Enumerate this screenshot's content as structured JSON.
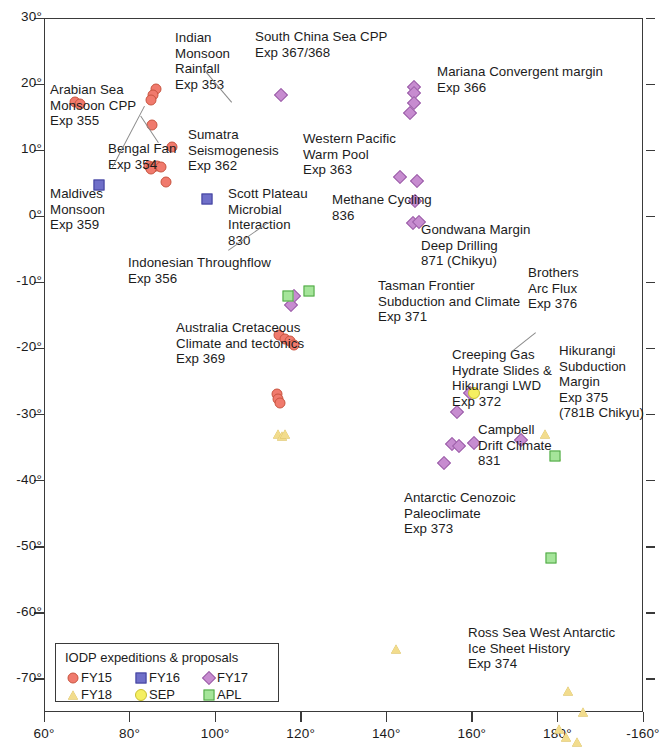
{
  "chart_data": {
    "type": "scatter",
    "title": "",
    "xlabel": "",
    "ylabel": "",
    "xlim": [
      60,
      200
    ],
    "ylim": [
      -75,
      30
    ],
    "grid": false,
    "legend_position": "bottom-left",
    "x_ticks": [
      "60°",
      "80°",
      "100°",
      "120°",
      "140°",
      "160°",
      "180°",
      "-160°"
    ],
    "x_tick_values": [
      60,
      80,
      100,
      120,
      140,
      160,
      180,
      200
    ],
    "y_ticks": [
      "30°",
      "20°",
      "10°",
      "0°",
      "-10°",
      "-20°",
      "-30°",
      "-40°",
      "-50°",
      "-60°",
      "-70°"
    ],
    "y_tick_values": [
      30,
      20,
      10,
      0,
      -10,
      -20,
      -30,
      -40,
      -50,
      -60,
      -70
    ],
    "series": [
      {
        "name": "FY15",
        "color": "#f07a6d",
        "marker": "circle",
        "points": [
          [
            67.2,
            17.3
          ],
          [
            68.4,
            17.0
          ],
          [
            86.2,
            19.2
          ],
          [
            85.4,
            18.3
          ],
          [
            85.0,
            17.6
          ],
          [
            85.2,
            13.8
          ],
          [
            89.8,
            10.5
          ],
          [
            84.6,
            7.6
          ],
          [
            85.4,
            7.5
          ],
          [
            86.3,
            7.6
          ],
          [
            87.3,
            7.5
          ],
          [
            85.0,
            7.2
          ],
          [
            88.5,
            5.2
          ],
          [
            115.0,
            -18.0
          ],
          [
            116.4,
            -18.5
          ],
          [
            117.6,
            -18.9
          ],
          [
            118.4,
            -19.4
          ],
          [
            114.5,
            -26.9
          ],
          [
            114.8,
            -27.6
          ],
          [
            115.1,
            -28.3
          ]
        ]
      },
      {
        "name": "FY16",
        "color": "#6f6fc9",
        "marker": "square",
        "points": [
          [
            72.9,
            4.8
          ],
          [
            98.0,
            2.6
          ]
        ]
      },
      {
        "name": "FY17",
        "color": "#c78cd0",
        "marker": "diamond",
        "points": [
          [
            115.3,
            18.4
          ],
          [
            146.4,
            19.6
          ],
          [
            146.5,
            18.6
          ],
          [
            146.4,
            17.2
          ],
          [
            145.6,
            15.7
          ],
          [
            143.2,
            5.9
          ],
          [
            147.2,
            5.4
          ],
          [
            146.6,
            2.3
          ],
          [
            146.3,
            -1.0
          ],
          [
            147.6,
            -0.8
          ],
          [
            118.5,
            -12.0
          ],
          [
            117.8,
            -13.4
          ],
          [
            159.6,
            -26.8
          ],
          [
            156.6,
            -29.6
          ],
          [
            155.3,
            -34.5
          ],
          [
            157.0,
            -34.8
          ],
          [
            160.5,
            -34.3
          ],
          [
            153.5,
            -37.3
          ],
          [
            171.6,
            -33.8
          ]
        ]
      },
      {
        "name": "FY18",
        "color": "#f2dc8d",
        "marker": "triangle",
        "points": [
          [
            114.6,
            -33.0
          ],
          [
            115.6,
            -33.2
          ],
          [
            116.3,
            -32.9
          ],
          [
            177.0,
            -32.9
          ],
          [
            179.6,
            -36.3
          ],
          [
            142.2,
            -65.5
          ],
          [
            182.5,
            -71.8
          ],
          [
            186.0,
            -75.0
          ],
          [
            180.4,
            -77.5
          ],
          [
            182.0,
            -78.8
          ],
          [
            184.5,
            -79.5
          ]
        ]
      },
      {
        "name": "SEP",
        "color": "#f5ef61",
        "marker": "circle",
        "points": [
          [
            160.4,
            -26.7
          ]
        ]
      },
      {
        "name": "APL",
        "color": "#a5e59a",
        "marker": "square",
        "points": [
          [
            117.0,
            -12.1
          ],
          [
            122.0,
            -11.3
          ],
          [
            178.6,
            -51.7
          ],
          [
            179.4,
            -36.2
          ]
        ]
      }
    ],
    "annotations": [
      {
        "text": "Arabian Sea\nMonsoon CPP\nExp 355",
        "x": 50,
        "y": 82,
        "align": "left"
      },
      {
        "text": "Maldives\nMonsoon\nExp 359",
        "x": 50,
        "y": 186,
        "align": "left"
      },
      {
        "text": "Bengal Fan\nExp 354",
        "x": 108,
        "y": 141,
        "align": "left"
      },
      {
        "text": "Indian\nMonsoon\nRainfall\nExp 353",
        "x": 175,
        "y": 30,
        "align": "left"
      },
      {
        "text": "Sumatra\nSeismogenesis\nExp 362",
        "x": 188,
        "y": 127,
        "align": "left"
      },
      {
        "text": "South China Sea CPP\nExp 367/368",
        "x": 255,
        "y": 29,
        "align": "left"
      },
      {
        "text": "Mariana Convergent margin\nExp 366",
        "x": 437,
        "y": 64,
        "align": "left"
      },
      {
        "text": "Western Pacific\nWarm Pool\nExp 363",
        "x": 303,
        "y": 131,
        "align": "left"
      },
      {
        "text": "Scott Plateau\nMicrobial\nInteraction\n830",
        "x": 228,
        "y": 186,
        "align": "left"
      },
      {
        "text": "Methane Cycling\n836",
        "x": 332,
        "y": 192,
        "align": "left"
      },
      {
        "text": "Indonesian Throughflow\nExp 356",
        "x": 128,
        "y": 255,
        "align": "left"
      },
      {
        "text": "Australia Cretaceous\nClimate and tectonics\nExp 369",
        "x": 176,
        "y": 320,
        "align": "left"
      },
      {
        "text": "Gondwana Margin\nDeep Drilling\n871 (Chikyu)",
        "x": 421,
        "y": 222,
        "align": "left"
      },
      {
        "text": "Tasman Frontier\nSubduction and Climate\nExp 371",
        "x": 378,
        "y": 278,
        "align": "left"
      },
      {
        "text": "Brothers\nArc Flux\nExp 376",
        "x": 528,
        "y": 265,
        "align": "left"
      },
      {
        "text": "Creeping Gas\nHydrate Slides &\nHikurangi LWD\nExp 372",
        "x": 452,
        "y": 347,
        "align": "left"
      },
      {
        "text": "Hikurangi\nSubduction\nMargin\nExp 375\n(781B Chikyu)",
        "x": 559,
        "y": 343,
        "align": "left"
      },
      {
        "text": "Campbell\nDrift Climate\n831",
        "x": 478,
        "y": 422,
        "align": "left"
      },
      {
        "text": "Antarctic Cenozoic\nPaleoclimate\nExp 373",
        "x": 404,
        "y": 490,
        "align": "left"
      },
      {
        "text": "Ross Sea West Antarctic\nIce Sheet History\nExp 374",
        "x": 468,
        "y": 625,
        "align": "left"
      }
    ]
  },
  "legend": {
    "title": "IODP expeditions & proposals",
    "entries": [
      {
        "label": "FY15",
        "marker": "fy15"
      },
      {
        "label": "FY16",
        "marker": "fy16"
      },
      {
        "label": "FY17",
        "marker": "fy17"
      },
      {
        "label": "FY18",
        "marker": "fy18"
      },
      {
        "label": "SEP",
        "marker": "sep"
      },
      {
        "label": "APL",
        "marker": "apl"
      }
    ]
  }
}
